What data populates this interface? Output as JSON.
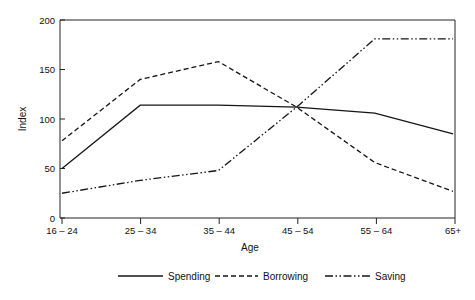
{
  "chart_data": {
    "type": "line",
    "title": "",
    "xlabel": "Age",
    "ylabel": "Index",
    "categories": [
      "16 – 24",
      "25 – 34",
      "35 – 44",
      "45 – 54",
      "55 – 64",
      "65+"
    ],
    "ylim": [
      0,
      200
    ],
    "yticks": [
      0,
      50,
      100,
      150,
      200
    ],
    "ytick_labels": [
      "0",
      "50",
      "100",
      "150",
      "200"
    ],
    "grid": false,
    "legend_position": "bottom",
    "series": [
      {
        "name": "Spending",
        "style": "solid",
        "values": [
          50,
          114,
          114,
          112,
          106,
          85
        ]
      },
      {
        "name": "Borrowing",
        "style": "dashed",
        "values": [
          78,
          140,
          158,
          112,
          56,
          27
        ]
      },
      {
        "name": "Saving",
        "style": "dash-dot-dot",
        "values": [
          25,
          38,
          48,
          112,
          181,
          181
        ]
      }
    ]
  },
  "legend": {
    "items": [
      {
        "label": "Spending",
        "style": "solid"
      },
      {
        "label": "Borrowing",
        "style": "dashed"
      },
      {
        "label": "Saving",
        "style": "dash-dot-dot"
      }
    ]
  },
  "colors": {
    "ink": "#151515",
    "axis": "#222222",
    "background": "#ffffff"
  }
}
